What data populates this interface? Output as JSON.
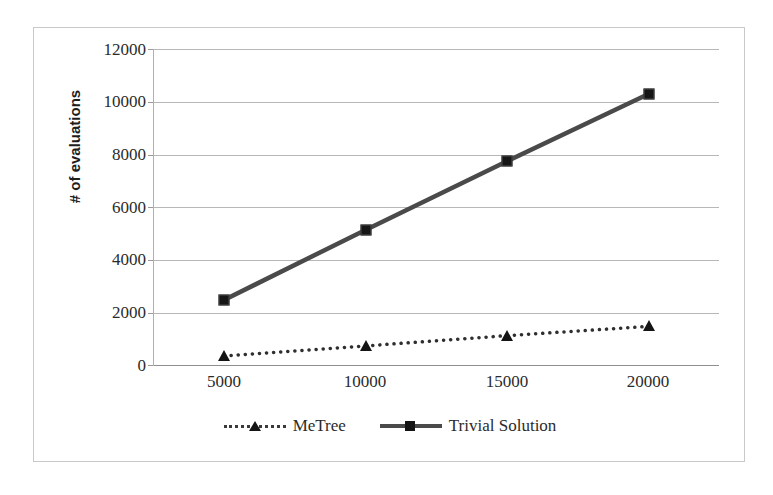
{
  "chart_data": {
    "type": "line",
    "title": "",
    "xlabel": "",
    "ylabel": "# of evaluations",
    "x": [
      5000,
      10000,
      15000,
      20000
    ],
    "categories": [
      "5000",
      "10000",
      "15000",
      "20000"
    ],
    "ylim": [
      0,
      12000
    ],
    "y_ticks": [
      0,
      2000,
      4000,
      6000,
      8000,
      10000,
      12000
    ],
    "y_tick_labels": [
      "0",
      "2000",
      "4000",
      "6000",
      "8000",
      "10000",
      "12000"
    ],
    "grid": true,
    "legend_position": "bottom",
    "series": [
      {
        "name": "MeTree",
        "values": [
          380,
          760,
          1150,
          1500
        ],
        "line_style": "dotted",
        "marker": "triangle",
        "color": "#2f2f2f"
      },
      {
        "name": "Trivial Solution",
        "values": [
          2500,
          5150,
          7750,
          10300
        ],
        "line_style": "solid",
        "marker": "square",
        "color": "#4a4a4a"
      }
    ]
  },
  "axis": {
    "y_title": "# of evaluations",
    "y_tick_labels": [
      "12000",
      "10000",
      "8000",
      "6000",
      "4000",
      "2000",
      "0"
    ],
    "x_tick_labels": [
      "5000",
      "10000",
      "15000",
      "20000"
    ]
  },
  "legend": {
    "entries": [
      {
        "label": "MeTree",
        "key": "dotted-triangle-key"
      },
      {
        "label": "Trivial Solution",
        "key": "solid-square-key"
      }
    ]
  },
  "colors": {
    "series_metree": "#2f2f2f",
    "series_trivial": "#4a4a4a",
    "gridline": "#b7b7b7",
    "frame_border": "#c9c9c9",
    "text": "#2b2b2b"
  }
}
